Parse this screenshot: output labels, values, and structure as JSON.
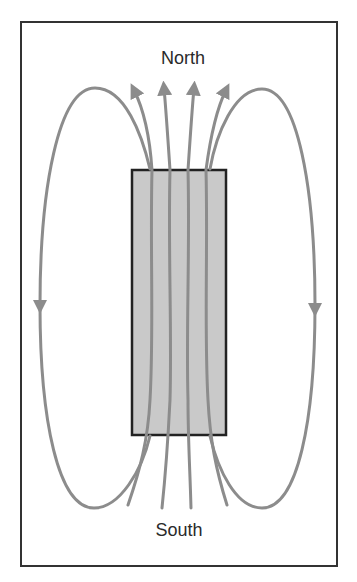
{
  "diagram": {
    "labels": {
      "north": "North",
      "south": "South"
    },
    "colors": {
      "background": "#ffffff",
      "frame": "#333333",
      "magnet_fill": "#c9c9c9",
      "magnet_border": "#222222",
      "field_line": "#8c8c8c",
      "text": "#2a2a2a"
    },
    "frame": {
      "x": 21,
      "y": 22,
      "width": 316,
      "height": 544
    },
    "magnet": {
      "x": 132,
      "y": 170,
      "width": 94,
      "height": 265
    },
    "field_lines": {
      "inner_up_arrows": 4,
      "outer_loops": 2,
      "loop_arrow_direction": "down"
    }
  }
}
